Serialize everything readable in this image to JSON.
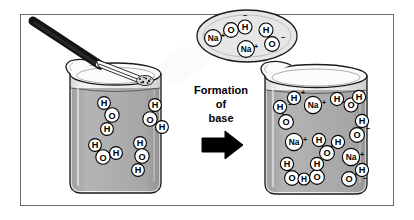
{
  "figure": {
    "caption_lines": [
      "Formation",
      "of",
      "base"
    ],
    "arrow_icon": "right-arrow-icon",
    "frame": {
      "border_color": "#6b6b6b",
      "background": "#ffffff"
    }
  },
  "colors": {
    "liquid_gray": "#a9a9a9",
    "liquid_gray_dark": "#9a9a9a",
    "glass_gray": "#efefef",
    "highlight": "#f4f4f4",
    "outline": "#1a1a1a",
    "bubble_fill": "#e3e3e3",
    "metal_dark": "#1c1c1c",
    "arrow_black": "#000000"
  },
  "left_beaker": {
    "name": "beaker-with-water",
    "contents_label": "water",
    "molecules": [
      {
        "type": "water",
        "formula": "H2O",
        "atoms": [
          "H",
          "O",
          "H"
        ]
      },
      {
        "type": "water",
        "formula": "H2O",
        "atoms": [
          "H",
          "O",
          "H"
        ]
      },
      {
        "type": "water",
        "formula": "H2O",
        "atoms": [
          "H",
          "O",
          "H"
        ]
      },
      {
        "type": "water",
        "formula": "H2O",
        "atoms": [
          "H",
          "O",
          "H"
        ]
      }
    ],
    "molecule_count": 4
  },
  "tongs": {
    "name": "tongs-holding-sodium",
    "handle_label": "tongs",
    "sample_label": "sodium metal"
  },
  "bubble": {
    "name": "ion-bubble",
    "description": "gas bubble above beaker containing dissociated ions",
    "ions": [
      {
        "label": "Na",
        "charge": "+"
      },
      {
        "label": "O",
        "partner": "H",
        "charge": "−"
      },
      {
        "label": "H",
        "partner": "O",
        "charge": "−"
      },
      {
        "label": "Na",
        "charge": "+"
      }
    ],
    "sodium_count": 2,
    "hydroxide_count": 2
  },
  "right_beaker": {
    "name": "beaker-with-base-solution",
    "contents_label": "sodium hydroxide solution",
    "sodium_ions": [
      {
        "label": "Na",
        "charge": "+"
      },
      {
        "label": "Na",
        "charge": "+"
      },
      {
        "label": "Na",
        "charge": "+"
      }
    ],
    "hydroxide_ions": [
      {
        "atoms": [
          "H",
          "O"
        ],
        "charge": "−"
      },
      {
        "atoms": [
          "H",
          "O"
        ],
        "charge": "−"
      },
      {
        "atoms": [
          "H",
          "O"
        ],
        "charge": "−"
      },
      {
        "atoms": [
          "H",
          "O"
        ],
        "charge": "−"
      },
      {
        "atoms": [
          "H",
          "O"
        ],
        "charge": "−"
      }
    ],
    "water_molecules": [
      {
        "atoms": [
          "H",
          "O",
          "H"
        ]
      },
      {
        "atoms": [
          "H",
          "O",
          "H"
        ]
      },
      {
        "atoms": [
          "H",
          "O",
          "H"
        ]
      }
    ],
    "hydrogen_cation": {
      "label": "H",
      "charge": "+"
    },
    "sodium_count": 3,
    "hydroxide_count": 5,
    "water_count": 3
  },
  "atom_glyphs": {
    "hydrogen": "H",
    "oxygen": "O",
    "sodium": "Na",
    "plus": "+",
    "minus": "−"
  }
}
